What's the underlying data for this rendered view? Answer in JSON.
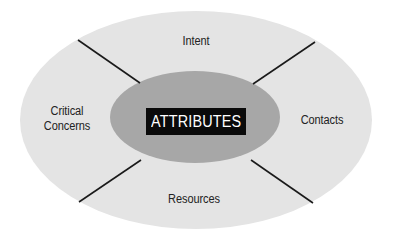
{
  "diagram": {
    "center": {
      "label": "ATTRIBUTES"
    },
    "segments": [
      {
        "position": "top",
        "label": "Intent"
      },
      {
        "position": "right",
        "label": "Contacts"
      },
      {
        "position": "bottom",
        "label": "Resources"
      },
      {
        "position": "left",
        "label_lines": [
          "Critical",
          "Concerns"
        ]
      }
    ],
    "colors": {
      "outer_ellipse": "#e4e4e4",
      "inner_ellipse": "#a7a7a7",
      "center_box": "#0a0a0a",
      "center_text": "#ffffff",
      "divider_lines": "#1a1a1a",
      "segment_text": "#222222"
    }
  }
}
